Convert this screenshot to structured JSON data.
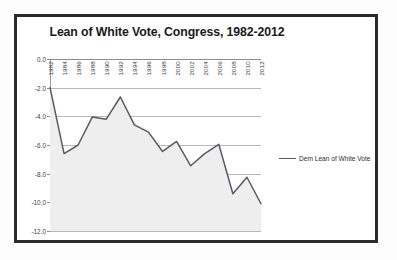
{
  "chart_data": {
    "type": "line",
    "title": "Lean of White Vote, Congress, 1982-2012",
    "xlabel": "",
    "ylabel": "",
    "categories": [
      "1982",
      "1984",
      "1986",
      "1988",
      "1990",
      "1992",
      "1994",
      "1996",
      "1998",
      "2000",
      "2002",
      "2004",
      "2006",
      "2008",
      "2010",
      "2012"
    ],
    "series": [
      {
        "name": "Dem Lean of White Vote",
        "values": [
          -2.0,
          -6.6,
          -6.0,
          -4.05,
          -4.2,
          -2.65,
          -4.6,
          -5.1,
          -6.45,
          -5.75,
          -7.45,
          -6.6,
          -5.95,
          -9.4,
          -8.25,
          -10.1
        ]
      }
    ],
    "ylim": [
      -12.0,
      0.0
    ],
    "yticks": [
      "0.0",
      "-2.0",
      "-4.0",
      "-6.0",
      "-8.0",
      "-10.0",
      "-12.0"
    ],
    "ytick_values": [
      0.0,
      -2.0,
      -4.0,
      -6.0,
      -8.0,
      -10.0,
      -12.0
    ],
    "grid": true,
    "legend_position": "right",
    "legend_entries": [
      "Dem Lean of White Vote"
    ],
    "line_color": "#5a5a66",
    "fill_color": "#eeeeee"
  },
  "legend": {
    "label": "Dem Lean of White Vote"
  }
}
